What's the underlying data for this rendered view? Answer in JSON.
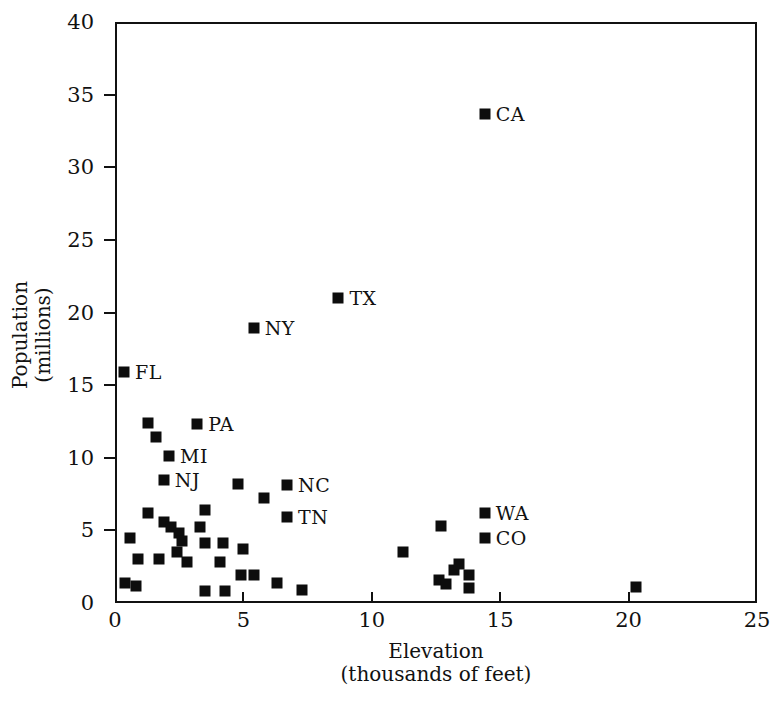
{
  "chart_data": {
    "type": "scatter",
    "title": "",
    "xlabel": "Elevation (thousands of feet)",
    "xlabel_line1": "Elevation",
    "xlabel_line2": "(thousands of feet)",
    "ylabel": "Population (millions)",
    "ylabel_line1": "Population",
    "ylabel_line2": "(millions)",
    "xlim": [
      0,
      25
    ],
    "ylim": [
      0,
      40
    ],
    "xticks": [
      0,
      5,
      10,
      15,
      20,
      25
    ],
    "yticks": [
      0,
      5,
      10,
      15,
      20,
      25,
      30,
      35,
      40
    ],
    "xticklabels": [
      "0",
      "5",
      "10",
      "15",
      "20",
      "25"
    ],
    "yticklabels": [
      "0",
      "5",
      "10",
      "15",
      "20",
      "25",
      "30",
      "35",
      "40"
    ],
    "grid": false,
    "legend": null,
    "marker": "square",
    "marker_color": "#0d0d0d",
    "points": [
      {
        "x": 14.4,
        "y": 33.7,
        "label": "CA"
      },
      {
        "x": 8.7,
        "y": 21.0,
        "label": "TX"
      },
      {
        "x": 5.4,
        "y": 18.9,
        "label": "NY"
      },
      {
        "x": 0.35,
        "y": 15.9,
        "label": "FL"
      },
      {
        "x": 3.2,
        "y": 12.3,
        "label": "PA"
      },
      {
        "x": 2.1,
        "y": 10.1,
        "label": "MI"
      },
      {
        "x": 1.9,
        "y": 8.5,
        "label": "NJ"
      },
      {
        "x": 6.7,
        "y": 8.1,
        "label": "NC"
      },
      {
        "x": 6.7,
        "y": 5.9,
        "label": "TN"
      },
      {
        "x": 14.4,
        "y": 6.2,
        "label": "WA"
      },
      {
        "x": 14.4,
        "y": 4.5,
        "label": "CO"
      },
      {
        "x": 1.3,
        "y": 12.4,
        "label": ""
      },
      {
        "x": 1.6,
        "y": 11.4,
        "label": ""
      },
      {
        "x": 4.8,
        "y": 8.2,
        "label": ""
      },
      {
        "x": 5.8,
        "y": 7.2,
        "label": ""
      },
      {
        "x": 1.3,
        "y": 6.2,
        "label": ""
      },
      {
        "x": 3.5,
        "y": 6.4,
        "label": ""
      },
      {
        "x": 1.9,
        "y": 5.6,
        "label": ""
      },
      {
        "x": 2.2,
        "y": 5.2,
        "label": ""
      },
      {
        "x": 3.3,
        "y": 5.2,
        "label": ""
      },
      {
        "x": 2.5,
        "y": 4.8,
        "label": ""
      },
      {
        "x": 2.6,
        "y": 4.3,
        "label": ""
      },
      {
        "x": 0.6,
        "y": 4.5,
        "label": ""
      },
      {
        "x": 12.7,
        "y": 5.3,
        "label": ""
      },
      {
        "x": 3.5,
        "y": 4.1,
        "label": ""
      },
      {
        "x": 4.2,
        "y": 4.1,
        "label": ""
      },
      {
        "x": 2.4,
        "y": 3.5,
        "label": ""
      },
      {
        "x": 5.0,
        "y": 3.7,
        "label": ""
      },
      {
        "x": 11.2,
        "y": 3.5,
        "label": ""
      },
      {
        "x": 0.9,
        "y": 3.0,
        "label": ""
      },
      {
        "x": 1.7,
        "y": 3.0,
        "label": ""
      },
      {
        "x": 2.8,
        "y": 2.8,
        "label": ""
      },
      {
        "x": 4.1,
        "y": 2.8,
        "label": ""
      },
      {
        "x": 4.9,
        "y": 1.9,
        "label": ""
      },
      {
        "x": 5.4,
        "y": 1.9,
        "label": ""
      },
      {
        "x": 6.3,
        "y": 1.4,
        "label": ""
      },
      {
        "x": 0.4,
        "y": 1.4,
        "label": ""
      },
      {
        "x": 0.8,
        "y": 1.2,
        "label": ""
      },
      {
        "x": 3.5,
        "y": 0.8,
        "label": ""
      },
      {
        "x": 4.3,
        "y": 0.8,
        "label": ""
      },
      {
        "x": 7.3,
        "y": 0.9,
        "label": ""
      },
      {
        "x": 12.6,
        "y": 1.6,
        "label": ""
      },
      {
        "x": 12.9,
        "y": 1.3,
        "label": ""
      },
      {
        "x": 13.2,
        "y": 2.3,
        "label": ""
      },
      {
        "x": 13.4,
        "y": 2.7,
        "label": ""
      },
      {
        "x": 13.8,
        "y": 1.9,
        "label": ""
      },
      {
        "x": 13.8,
        "y": 1.0,
        "label": ""
      },
      {
        "x": 20.3,
        "y": 1.1,
        "label": ""
      }
    ]
  }
}
